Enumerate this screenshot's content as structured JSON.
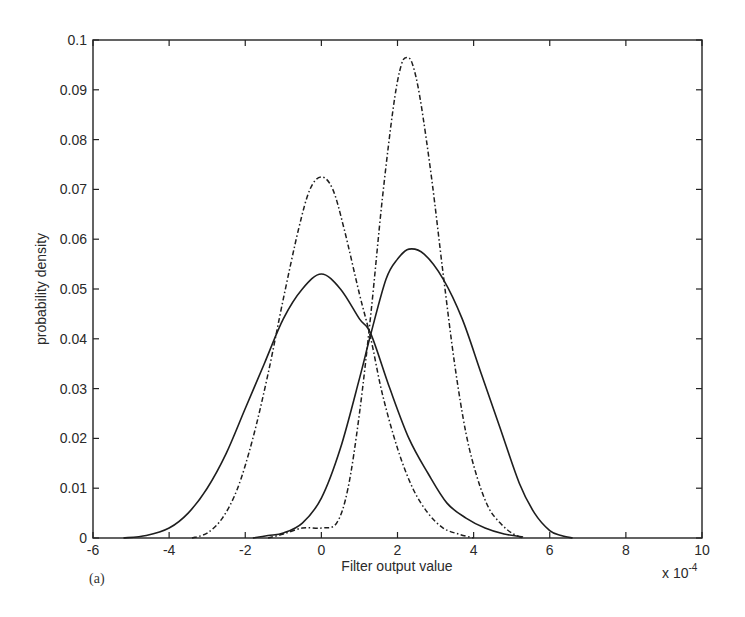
{
  "chart_data": {
    "type": "line",
    "title": "",
    "panel_label": "(a)",
    "xlabel": "Filter output value",
    "ylabel": "probability density",
    "x_multiplier_label": "x 10",
    "x_multiplier_exp": "-4",
    "xlim": [
      -6,
      10
    ],
    "ylim": [
      0,
      0.1
    ],
    "grid": false,
    "legend": null,
    "xticks": [
      -6,
      -4,
      -2,
      0,
      2,
      4,
      6,
      8,
      10
    ],
    "xtick_labels": [
      "-6",
      "-4",
      "-2",
      "0",
      "2",
      "4",
      "6",
      "8",
      "10"
    ],
    "yticks": [
      0,
      0.01,
      0.02,
      0.03,
      0.04,
      0.05,
      0.06,
      0.07,
      0.08,
      0.09,
      0.1
    ],
    "ytick_labels": [
      "0",
      "0.01",
      "0.02",
      "0.03",
      "0.04",
      "0.05",
      "0.06",
      "0.07",
      "0.08",
      "0.09",
      "0.1"
    ],
    "series": [
      {
        "name": "solid-left",
        "style": "solid",
        "x": [
          -5.2,
          -4.6,
          -4.0,
          -3.5,
          -3.0,
          -2.5,
          -2.0,
          -1.5,
          -1.0,
          -0.5,
          0.0,
          0.5,
          1.0,
          1.3,
          1.8,
          2.3,
          2.8,
          3.3,
          3.8,
          4.3,
          4.8,
          5.3
        ],
        "values": [
          0.0,
          0.0005,
          0.002,
          0.005,
          0.01,
          0.017,
          0.026,
          0.035,
          0.044,
          0.05,
          0.053,
          0.05,
          0.044,
          0.041,
          0.03,
          0.02,
          0.013,
          0.007,
          0.004,
          0.002,
          0.0008,
          0.0002
        ]
      },
      {
        "name": "dashdot-left",
        "style": "dashdot",
        "x": [
          -3.4,
          -3.0,
          -2.6,
          -2.2,
          -1.8,
          -1.4,
          -1.0,
          -0.6,
          -0.3,
          0.0,
          0.3,
          0.6,
          1.0,
          1.3,
          1.6,
          2.0,
          2.4,
          2.8,
          3.2,
          3.6,
          4.0
        ],
        "values": [
          0.0,
          0.001,
          0.004,
          0.01,
          0.02,
          0.033,
          0.048,
          0.062,
          0.07,
          0.0725,
          0.07,
          0.062,
          0.049,
          0.04,
          0.029,
          0.018,
          0.01,
          0.005,
          0.002,
          0.0008,
          0.0
        ]
      },
      {
        "name": "solid-right",
        "style": "solid",
        "x": [
          -1.8,
          -1.4,
          -1.0,
          -0.5,
          0.0,
          0.5,
          1.0,
          1.3,
          1.7,
          2.0,
          2.3,
          2.7,
          3.2,
          3.7,
          4.2,
          4.7,
          5.2,
          5.6,
          6.0,
          6.3,
          6.6
        ],
        "values": [
          0.0,
          0.0005,
          0.001,
          0.003,
          0.008,
          0.018,
          0.032,
          0.041,
          0.052,
          0.056,
          0.058,
          0.057,
          0.052,
          0.044,
          0.033,
          0.022,
          0.011,
          0.005,
          0.0015,
          0.0005,
          0.0
        ]
      },
      {
        "name": "dashdot-right",
        "style": "dashdot",
        "x": [
          -1.4,
          -1.0,
          -0.5,
          0.0,
          0.4,
          0.7,
          1.0,
          1.3,
          1.6,
          1.9,
          2.1,
          2.25,
          2.4,
          2.6,
          2.9,
          3.2,
          3.5,
          3.8,
          4.1,
          4.4,
          4.7,
          5.0,
          5.3
        ],
        "values": [
          0.0,
          0.0008,
          0.002,
          0.002,
          0.003,
          0.01,
          0.025,
          0.045,
          0.068,
          0.087,
          0.095,
          0.0965,
          0.095,
          0.088,
          0.072,
          0.053,
          0.035,
          0.021,
          0.012,
          0.006,
          0.003,
          0.001,
          0.0
        ]
      }
    ]
  }
}
